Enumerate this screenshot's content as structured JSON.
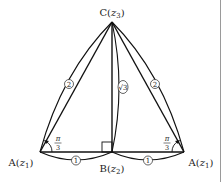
{
  "figure": {
    "points": {
      "C": {
        "label": "C(",
        "var": "z",
        "sub": "3",
        "close": ")"
      },
      "A_left": {
        "label": "A(",
        "var": "z",
        "sub": "1",
        "close": ")"
      },
      "B": {
        "label": "B(",
        "var": "z",
        "sub": "2",
        "close": ")"
      },
      "A_right": {
        "label": "A(",
        "var": "z",
        "sub": "1",
        "close": ")"
      }
    },
    "lengths": {
      "left_side": "2",
      "right_side": "2",
      "height": "√3",
      "left_base": "1",
      "right_base": "1"
    },
    "angles": {
      "left": {
        "num": "π",
        "den": "3"
      },
      "right": {
        "num": "π",
        "den": "3"
      }
    },
    "right_angle_marker": true,
    "colors": {
      "stroke": "#111111",
      "text": "#222222",
      "border": "#999999"
    }
  }
}
